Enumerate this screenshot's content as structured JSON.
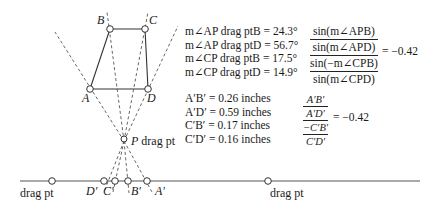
{
  "points": {
    "A": {
      "label": "A",
      "x": 90,
      "y": 89
    },
    "B": {
      "label": "B",
      "x": 110,
      "y": 29
    },
    "C": {
      "label": "C",
      "x": 145,
      "y": 29
    },
    "D": {
      "label": "D",
      "x": 148,
      "y": 89
    },
    "P": {
      "label": "P",
      "suffix": " drag pt",
      "x": 124,
      "y": 141
    }
  },
  "line": {
    "y": 181,
    "x_start": 20,
    "x_end": 420,
    "left_drag_label": "drag pt",
    "right_drag_label": "drag pt",
    "left_drag_x": 52,
    "right_drag_x": 268
  },
  "projected": {
    "D_prime": {
      "label": "D′",
      "x": 104
    },
    "C_prime": {
      "label": "C′",
      "x": 115
    },
    "B_prime": {
      "label": "B′",
      "x": 128
    },
    "A_prime": {
      "label": "A′",
      "x": 147
    }
  },
  "angle_measurements": [
    {
      "text": "m∠AP drag ptB = 24.3°"
    },
    {
      "text": "m∠AP drag ptD = 56.7°"
    },
    {
      "text": "m∠CP drag ptB = 17.5°"
    },
    {
      "text": "m∠CP drag ptD = 14.9°"
    }
  ],
  "length_measurements": [
    {
      "text": "A′B′ = 0.26 inches"
    },
    {
      "text": "A′D′ = 0.59 inches"
    },
    {
      "text": "C′B′ = 0.17 inches"
    },
    {
      "text": "C′D′ = 0.16 inches"
    }
  ],
  "sine_ratio": {
    "num_top": "sin(m∠APB)",
    "num_bottom": "sin(m∠APD)",
    "den_top": "sin(−m∠CPB)",
    "den_bottom": "sin(m∠CPD)",
    "result": "= −0.42"
  },
  "length_ratio": {
    "num_top": "A′B′",
    "num_bottom": "A′D′",
    "den_top": "−C′B′",
    "den_bottom": "C′D′",
    "result": "= −0.42"
  }
}
